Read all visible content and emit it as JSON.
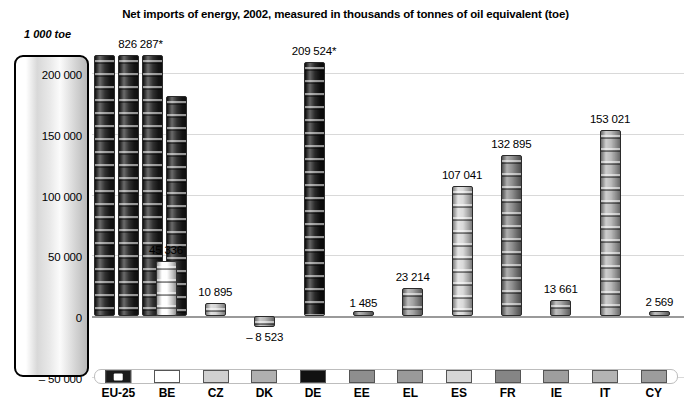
{
  "chart_data": {
    "type": "bar",
    "title": "Net imports of energy, 2002, measured in thousands of tonnes of oil equivalent (toe)",
    "unit_label": "1 000 toe",
    "xlabel": "",
    "ylabel": "1 000 toe",
    "ylim": [
      -50000,
      215000
    ],
    "grid": true,
    "legend_position": "bottom",
    "yticks": [
      {
        "value": 200000,
        "label": "200 000"
      },
      {
        "value": 150000,
        "label": "150 000"
      },
      {
        "value": 100000,
        "label": "100 000"
      },
      {
        "value": 50000,
        "label": "50 000"
      },
      {
        "value": 0,
        "label": "0"
      },
      {
        "value": -50000,
        "label": "– 50 000"
      }
    ],
    "categories": [
      "EU-25",
      "BE",
      "CZ",
      "DK",
      "DE",
      "EE",
      "EL",
      "ES",
      "FR",
      "IE",
      "IT",
      "CY"
    ],
    "values": [
      826287,
      45336,
      10895,
      -8523,
      209524,
      1485,
      23214,
      107041,
      132895,
      13661,
      153021,
      2569
    ],
    "value_labels": [
      "826 287*",
      "45 336",
      "10 895",
      "– 8 523",
      "209 524*",
      "1 485",
      "23 214",
      "107 041",
      "132 895",
      "13 661",
      "153 021",
      "2 569"
    ],
    "colors": [
      "#1a1a1a",
      "#ffffff",
      "#d0d0d0",
      "#b0b0b0",
      "#111111",
      "#8e8e8e",
      "#9a9a9a",
      "#d6d6d6",
      "#858585",
      "#9e9e9e",
      "#b4b4b4",
      "#9c9c9c"
    ]
  },
  "legend": {
    "items": [
      {
        "label": "EU-25",
        "color": "#1a1a1a",
        "icon": "eu-flag-swatch"
      },
      {
        "label": "BE",
        "color": "#ffffff",
        "icon": "color-swatch"
      },
      {
        "label": "CZ",
        "color": "#d0d0d0",
        "icon": "color-swatch"
      },
      {
        "label": "DK",
        "color": "#b0b0b0",
        "icon": "color-swatch"
      },
      {
        "label": "DE",
        "color": "#111111",
        "icon": "color-swatch"
      },
      {
        "label": "EE",
        "color": "#8e8e8e",
        "icon": "color-swatch"
      },
      {
        "label": "EL",
        "color": "#9a9a9a",
        "icon": "color-swatch"
      },
      {
        "label": "ES",
        "color": "#d6d6d6",
        "icon": "color-swatch"
      },
      {
        "label": "FR",
        "color": "#858585",
        "icon": "color-swatch"
      },
      {
        "label": "IE",
        "color": "#9e9e9e",
        "icon": "color-swatch"
      },
      {
        "label": "IT",
        "color": "#b4b4b4",
        "icon": "color-swatch"
      },
      {
        "label": "CY",
        "color": "#9c9c9c",
        "icon": "color-swatch"
      }
    ]
  }
}
